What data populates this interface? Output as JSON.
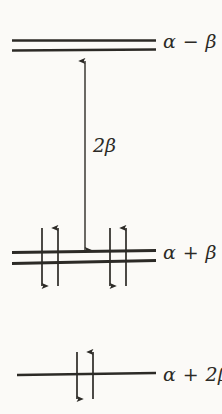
{
  "figure": {
    "kind": "molecular-orbital-energy-level-diagram",
    "background_color": "#fbfaf7",
    "ink_color": "#2c2a26",
    "width": 222,
    "height": 414
  },
  "levels": [
    {
      "id": "antibonding",
      "label": "α − β",
      "energy_expression": "alpha minus beta",
      "degeneracy": 2,
      "line_count": 2,
      "electrons": 0,
      "x_start": 12,
      "x_end": 156,
      "y": [
        40,
        50
      ]
    },
    {
      "id": "nonbonding",
      "label": "α + β",
      "energy_expression": "alpha plus beta",
      "degeneracy": 2,
      "line_count": 2,
      "electrons": 4,
      "x_start": 12,
      "x_end": 156,
      "y": [
        251,
        262
      ]
    },
    {
      "id": "bonding",
      "label": "α + 2β",
      "energy_expression": "alpha plus two beta",
      "degeneracy": 1,
      "line_count": 1,
      "electrons": 2,
      "x_start": 17,
      "x_end": 156,
      "y": [
        374
      ]
    }
  ],
  "electron_arrows": [
    {
      "level": "nonbonding",
      "x": 42,
      "direction": "down",
      "spin": "beta",
      "top": 228,
      "bottom": 286
    },
    {
      "level": "nonbonding",
      "x": 58,
      "direction": "up",
      "spin": "alpha",
      "top": 228,
      "bottom": 286
    },
    {
      "level": "nonbonding",
      "x": 110,
      "direction": "down",
      "spin": "beta",
      "top": 228,
      "bottom": 286
    },
    {
      "level": "nonbonding",
      "x": 126,
      "direction": "up",
      "spin": "alpha",
      "top": 228,
      "bottom": 286
    },
    {
      "level": "bonding",
      "x": 77,
      "direction": "down",
      "spin": "beta",
      "top": 352,
      "bottom": 399
    },
    {
      "level": "bonding",
      "x": 93,
      "direction": "up",
      "spin": "alpha",
      "top": 352,
      "bottom": 399
    }
  ],
  "gap_annotation": {
    "label": "2β",
    "from_level": "nonbonding",
    "to_level": "antibonding",
    "arrow_x": 85,
    "arrow_top": 61,
    "arrow_bottom": 250,
    "double_headed": true
  }
}
